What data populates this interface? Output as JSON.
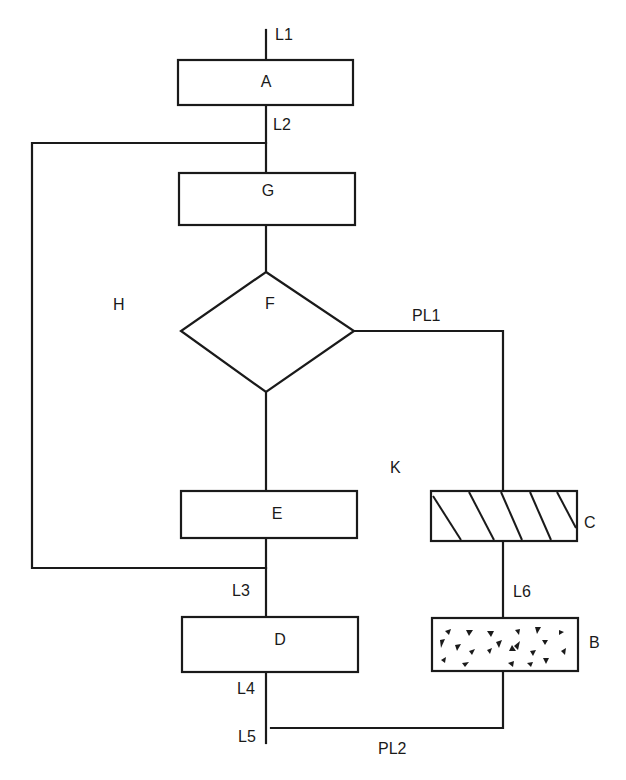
{
  "diagram": {
    "type": "flowchart",
    "nodes": {
      "A": {
        "label": "A",
        "shape": "rectangle"
      },
      "G": {
        "label": "G",
        "shape": "rectangle"
      },
      "F": {
        "label": "F",
        "shape": "diamond"
      },
      "E": {
        "label": "E",
        "shape": "rectangle"
      },
      "D": {
        "label": "D",
        "shape": "rectangle"
      },
      "C": {
        "label": "C",
        "shape": "rectangle-hatched"
      },
      "B": {
        "label": "B",
        "shape": "rectangle-stippled"
      }
    },
    "region_labels": {
      "H": "H",
      "K": "K"
    },
    "line_labels": {
      "L1": "L1",
      "L2": "L2",
      "L3": "L3",
      "L4": "L4",
      "L5": "L5",
      "L6": "L6",
      "PL1": "PL1",
      "PL2": "PL2"
    },
    "edges": [
      {
        "from": "L1",
        "to": "A"
      },
      {
        "from": "A",
        "to": "G",
        "label": "L2"
      },
      {
        "from": "L2",
        "to": "L3",
        "label": "H",
        "note": "bypass loop on left"
      },
      {
        "from": "G",
        "to": "F"
      },
      {
        "from": "F",
        "to": "E"
      },
      {
        "from": "F",
        "to": "C",
        "label": "PL1"
      },
      {
        "from": "E",
        "to": "D",
        "label": "L3"
      },
      {
        "from": "C",
        "to": "B",
        "label": "L6"
      },
      {
        "from": "D",
        "to": "L5",
        "label": "L4"
      },
      {
        "from": "B",
        "to": "L5",
        "label": "PL2"
      }
    ]
  }
}
